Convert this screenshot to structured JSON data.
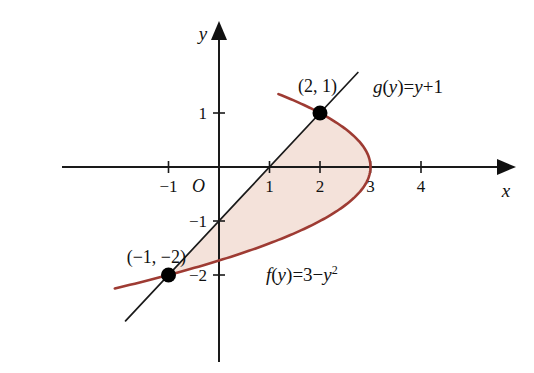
{
  "figure": {
    "background_color": "#ffffff",
    "axis_color": "#1a1a1a",
    "curve_color": "#9e3b33",
    "fill_color": "#f4e2da",
    "marker_color": "#000000"
  },
  "axes": {
    "x_axis_label": "x",
    "y_axis_label": "y",
    "origin_label": "O",
    "x_ticks": [
      "−1",
      "1",
      "2",
      "3",
      "4"
    ],
    "x_tick_values": [
      -1,
      1,
      2,
      3,
      4
    ],
    "y_ticks": [
      "1",
      "−1",
      "−2"
    ],
    "y_tick_values": [
      1,
      -1,
      -2
    ],
    "x_range": [
      -1.9,
      5.7
    ],
    "y_range": [
      -3.1,
      2.7
    ],
    "grid": false
  },
  "labels": {
    "point_upper": "(2, 1)",
    "point_lower": "(−1, −2)",
    "curve_label_parabola": "f(y) = 3 − y²",
    "curve_label_line": "g(y) = y + 1",
    "parabola_name": "f",
    "parabola_var": "(y)",
    "parabola_eq": "=3−",
    "parabola_y": "y",
    "parabola_exp": "2",
    "line_name": "g",
    "line_var": "(y)",
    "line_eq": "=",
    "line_y": "y",
    "line_plus": "+1"
  },
  "chart_data": {
    "type": "line",
    "title": "",
    "xlabel": "x",
    "ylabel": "y",
    "xlim": [
      -1.9,
      5.7
    ],
    "ylim": [
      -3.1,
      2.7
    ],
    "grid": false,
    "legend_position": "inline-annotation",
    "series": [
      {
        "name": "f(y) = 3 − y²",
        "type": "parabola-in-y",
        "equation": "x = 3 - y^2",
        "color": "#9e3b33",
        "y_domain": [
          -2.25,
          1.35
        ],
        "points": [
          {
            "y": 1.35,
            "x": 1.1775
          },
          {
            "y": 1.0,
            "x": 2.0
          },
          {
            "y": 0.5,
            "x": 2.75
          },
          {
            "y": 0.0,
            "x": 3.0
          },
          {
            "y": -0.5,
            "x": 2.75
          },
          {
            "y": -1.0,
            "x": 2.0
          },
          {
            "y": -1.5,
            "x": 0.75
          },
          {
            "y": -2.0,
            "x": -1.0
          },
          {
            "y": -2.25,
            "x": -2.0625
          }
        ]
      },
      {
        "name": "g(y) = y + 1",
        "type": "line-in-y",
        "equation": "x = y + 1",
        "color": "#1a1a1a",
        "y_domain": [
          -2.85,
          1.75
        ],
        "points": [
          {
            "y": 1.75,
            "x": 2.75
          },
          {
            "y": 1.0,
            "x": 2.0
          },
          {
            "y": 0.0,
            "x": 1.0
          },
          {
            "y": -1.0,
            "x": 0.0
          },
          {
            "y": -2.0,
            "x": -1.0
          },
          {
            "y": -2.85,
            "x": -1.85
          }
        ]
      }
    ],
    "shaded_region": {
      "label": "region between x = y + 1 and x = 3 − y²",
      "color": "#f4e2da",
      "y_from": -2,
      "y_to": 1
    },
    "marked_points": [
      {
        "label": "(2, 1)",
        "x": 2,
        "y": 1
      },
      {
        "label": "(−1, −2)",
        "x": -1,
        "y": -2
      }
    ]
  }
}
